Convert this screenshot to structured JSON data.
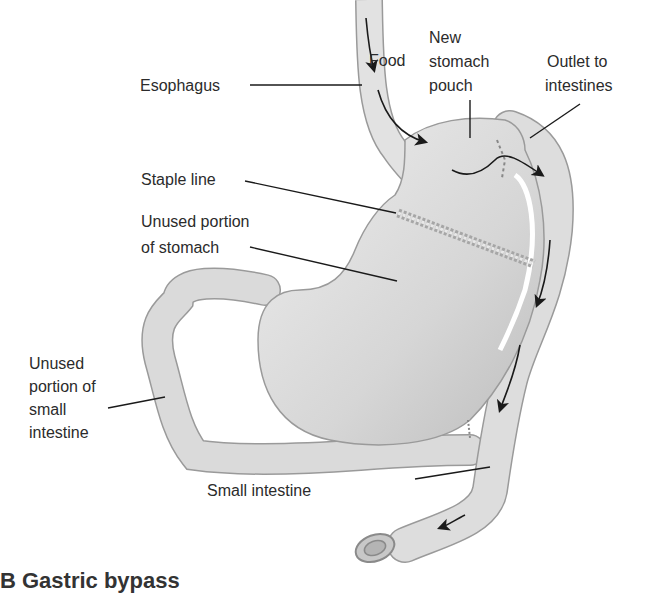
{
  "figure": {
    "type": "anatomical diagram",
    "subject": "gastric bypass",
    "labels": {
      "food": "Food",
      "esophagus": "Esophagus",
      "new_pouch_1": "New",
      "new_pouch_2": "stomach",
      "new_pouch_3": "pouch",
      "outlet_1": "Outlet to",
      "outlet_2": "intestines",
      "staple_line": "Staple line",
      "unused_stomach_1": "Unused portion",
      "unused_stomach_2": "of stomach",
      "unused_intestine_1": "Unused",
      "unused_intestine_2": "portion of",
      "unused_intestine_3": "small",
      "unused_intestine_4": "intestine",
      "small_intestine": "Small intestine"
    },
    "caption": "B Gastric bypass",
    "colors": {
      "organ_fill": "#dcdcdc",
      "organ_shade": "#b9b9b9",
      "outline": "#9a9a9a",
      "leader_line": "#1a1a1a",
      "text": "#2b2b2b"
    }
  }
}
